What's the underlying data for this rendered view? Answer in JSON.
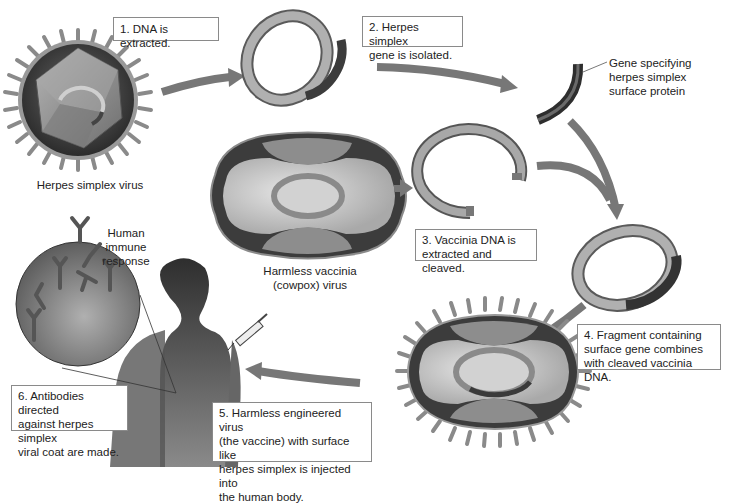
{
  "diagram": {
    "steps": [
      {
        "id": 1,
        "text": "1. DNA is extracted."
      },
      {
        "id": 2,
        "line1": "2. Herpes simplex",
        "line2": "gene is isolated."
      },
      {
        "id": 3,
        "line1": "3. Vaccinia DNA is",
        "line2": "extracted and cleaved."
      },
      {
        "id": 4,
        "line1": "4. Fragment containing",
        "line2": "surface gene combines",
        "line3": "with cleaved vaccinia DNA."
      },
      {
        "id": 5,
        "line1": "5. Harmless engineered virus",
        "line2": "(the vaccine) with surface like",
        "line3": "herpes simplex is injected into",
        "line4": "the human body."
      },
      {
        "id": 6,
        "line1": "6. Antibodies directed",
        "line2": "against herpes simplex",
        "line3": "viral coat are made."
      }
    ],
    "labels": {
      "herpes_virus": "Herpes simplex virus",
      "vaccinia_line1": "Harmless vaccinia",
      "vaccinia_line2": "(cowpox) virus",
      "gene_line1": "Gene specifying",
      "gene_line2": "herpes simplex",
      "gene_line3": "surface protein",
      "immune_line1": "Human immune",
      "immune_line2": "response"
    },
    "icons": [
      "herpes-virus-icon",
      "plasmid-dna-icon",
      "gene-fragment-icon",
      "vaccinia-virus-icon",
      "cleaved-dna-icon",
      "recombinant-dna-icon",
      "engineered-virus-icon",
      "human-silhouette-icon",
      "syringe-icon",
      "antibody-icon",
      "magnifier-circle-icon",
      "flow-arrow-icon"
    ],
    "colors": {
      "arrow": "#777777",
      "dna_light": "#a9a9a9",
      "dna_dark": "#3c3c3c",
      "virus_dark": "#3a3a3a",
      "capsid": "#8c8c8c",
      "body": "#4a4a4a",
      "box_border": "#8a8a8a"
    }
  }
}
